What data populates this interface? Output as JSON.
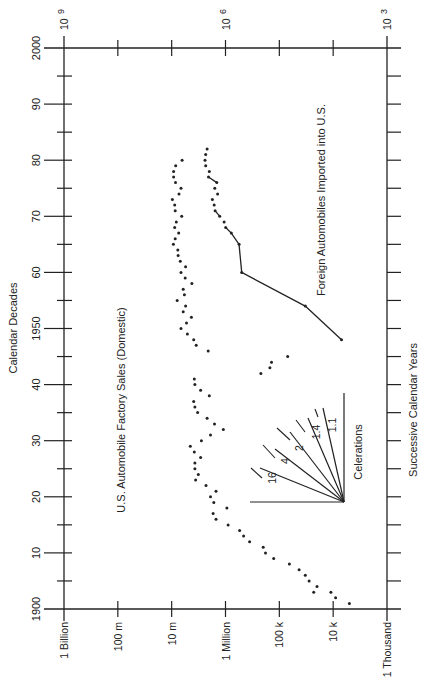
{
  "chart_data": {
    "type": "scatter",
    "orientation": "rotated-90-ccw",
    "title": "",
    "xlabel": "Calendar Decades",
    "ylabel": "",
    "secondary_xlabel": "Successive Calendar Years",
    "time_axis": {
      "label": "Calendar Decades",
      "secondary_label": "Successive Calendar Years",
      "range": [
        1900,
        2000
      ],
      "tick_labels": [
        "1900",
        "10",
        "20",
        "30",
        "40",
        "1950",
        "60",
        "70",
        "80",
        "90",
        "2000"
      ]
    },
    "value_axis": {
      "scale": "log",
      "range": [
        1000,
        1000000000
      ],
      "tick_labels": [
        "1 Billion",
        "100 m",
        "10 m",
        "1 Million",
        "100 k",
        "10 k",
        "1 Thousand"
      ],
      "top_tick_labels": [
        {
          "base": "10",
          "exp": "9"
        },
        {
          "base": "10",
          "exp": "6"
        },
        {
          "base": "10",
          "exp": "3"
        }
      ]
    },
    "grid": false,
    "legend": "inline annotations",
    "annotations": [
      "U.S. Automobile Factory Sales (Domestic)",
      "Foreign Automobiles Imported into U.S.",
      "Celerations"
    ],
    "celeration_fan": {
      "label": "Celerations",
      "lines": [
        "16",
        "4",
        "2",
        "1.4",
        "1.1"
      ]
    },
    "series": [
      {
        "name": "U.S. Automobile Factory Sales (Domestic)",
        "style": "dots",
        "points": [
          {
            "year": 1901,
            "value": 5000
          },
          {
            "year": 1902,
            "value": 9000
          },
          {
            "year": 1903,
            "value": 11000
          },
          {
            "year": 1903,
            "value": 23000
          },
          {
            "year": 1904,
            "value": 20000
          },
          {
            "year": 1905,
            "value": 28000
          },
          {
            "year": 1906,
            "value": 33000
          },
          {
            "year": 1907,
            "value": 43000
          },
          {
            "year": 1908,
            "value": 65000
          },
          {
            "year": 1909,
            "value": 127000
          },
          {
            "year": 1910,
            "value": 181000
          },
          {
            "year": 1911,
            "value": 199000
          },
          {
            "year": 1912,
            "value": 356000
          },
          {
            "year": 1913,
            "value": 462000
          },
          {
            "year": 1914,
            "value": 548000
          },
          {
            "year": 1915,
            "value": 896000
          },
          {
            "year": 1916,
            "value": 1500000
          },
          {
            "year": 1917,
            "value": 1700000
          },
          {
            "year": 1918,
            "value": 940000
          },
          {
            "year": 1919,
            "value": 1650000
          },
          {
            "year": 1920,
            "value": 1900000
          },
          {
            "year": 1921,
            "value": 1500000
          },
          {
            "year": 1922,
            "value": 2300000
          },
          {
            "year": 1923,
            "value": 3600000
          },
          {
            "year": 1924,
            "value": 3200000
          },
          {
            "year": 1925,
            "value": 3700000
          },
          {
            "year": 1926,
            "value": 3700000
          },
          {
            "year": 1927,
            "value": 2900000
          },
          {
            "year": 1928,
            "value": 3800000
          },
          {
            "year": 1929,
            "value": 4500000
          },
          {
            "year": 1930,
            "value": 2800000
          },
          {
            "year": 1931,
            "value": 1900000
          },
          {
            "year": 1932,
            "value": 1100000
          },
          {
            "year": 1933,
            "value": 1600000
          },
          {
            "year": 1934,
            "value": 2200000
          },
          {
            "year": 1935,
            "value": 3300000
          },
          {
            "year": 1936,
            "value": 3700000
          },
          {
            "year": 1937,
            "value": 3900000
          },
          {
            "year": 1938,
            "value": 2000000
          },
          {
            "year": 1939,
            "value": 2900000
          },
          {
            "year": 1940,
            "value": 3700000
          },
          {
            "year": 1941,
            "value": 3800000
          },
          {
            "year": 1942,
            "value": 220000
          },
          {
            "year": 1943,
            "value": 150000
          },
          {
            "year": 1944,
            "value": 140000
          },
          {
            "year": 1945,
            "value": 70000
          },
          {
            "year": 1946,
            "value": 2100000
          },
          {
            "year": 1947,
            "value": 3500000
          },
          {
            "year": 1948,
            "value": 3900000
          },
          {
            "year": 1949,
            "value": 5100000
          },
          {
            "year": 1950,
            "value": 6700000
          },
          {
            "year": 1951,
            "value": 5300000
          },
          {
            "year": 1952,
            "value": 4300000
          },
          {
            "year": 1953,
            "value": 6100000
          },
          {
            "year": 1954,
            "value": 5500000
          },
          {
            "year": 1955,
            "value": 7900000
          },
          {
            "year": 1956,
            "value": 5800000
          },
          {
            "year": 1957,
            "value": 6100000
          },
          {
            "year": 1958,
            "value": 4200000
          },
          {
            "year": 1959,
            "value": 5600000
          },
          {
            "year": 1960,
            "value": 6700000
          },
          {
            "year": 1961,
            "value": 5500000
          },
          {
            "year": 1962,
            "value": 6900000
          },
          {
            "year": 1963,
            "value": 7600000
          },
          {
            "year": 1964,
            "value": 7700000
          },
          {
            "year": 1965,
            "value": 9300000
          },
          {
            "year": 1966,
            "value": 8600000
          },
          {
            "year": 1967,
            "value": 7400000
          },
          {
            "year": 1968,
            "value": 8800000
          },
          {
            "year": 1969,
            "value": 8200000
          },
          {
            "year": 1970,
            "value": 6500000
          },
          {
            "year": 1971,
            "value": 8600000
          },
          {
            "year": 1972,
            "value": 8800000
          },
          {
            "year": 1973,
            "value": 9700000
          },
          {
            "year": 1974,
            "value": 7300000
          },
          {
            "year": 1975,
            "value": 6700000
          },
          {
            "year": 1976,
            "value": 8500000
          },
          {
            "year": 1977,
            "value": 9200000
          },
          {
            "year": 1978,
            "value": 9200000
          },
          {
            "year": 1979,
            "value": 8400000
          },
          {
            "year": 1980,
            "value": 6400000
          }
        ]
      },
      {
        "name": "Foreign Automobiles Imported into U.S.",
        "style": "dots-with-segments",
        "points": [
          {
            "year": 1948,
            "value": 7000
          },
          {
            "year": 1954,
            "value": 33000
          },
          {
            "year": 1960,
            "value": 500000
          },
          {
            "year": 1965,
            "value": 560000
          },
          {
            "year": 1967,
            "value": 780000
          },
          {
            "year": 1968,
            "value": 990000
          },
          {
            "year": 1969,
            "value": 1060000
          },
          {
            "year": 1970,
            "value": 1280000
          },
          {
            "year": 1971,
            "value": 1560000
          },
          {
            "year": 1972,
            "value": 1620000
          },
          {
            "year": 1973,
            "value": 1750000
          },
          {
            "year": 1974,
            "value": 1400000
          },
          {
            "year": 1975,
            "value": 1580000
          },
          {
            "year": 1976,
            "value": 1450000
          },
          {
            "year": 1977,
            "value": 2070000
          },
          {
            "year": 1978,
            "value": 2000000
          },
          {
            "year": 1979,
            "value": 2330000
          },
          {
            "year": 1980,
            "value": 2400000
          },
          {
            "year": 1981,
            "value": 2330000
          },
          {
            "year": 1982,
            "value": 2200000
          }
        ]
      }
    ]
  },
  "labels": {
    "time_axis_title": "Calendar Decades",
    "secondary_axis_title": "Successive Calendar Years",
    "domestic_series_label": "U.S. Automobile Factory Sales (Domestic)",
    "foreign_series_label": "Foreign Automobiles Imported into U.S.",
    "celerations_label": "Celerations",
    "celeration_values": [
      "16",
      "4",
      "2",
      "1.4",
      "1.1"
    ],
    "value_ticks": [
      "1 Billion",
      "100 m",
      "10 m",
      "1 Million",
      "100 k",
      "10 k",
      "1 Thousand"
    ],
    "decade_ticks": [
      "1900",
      "10",
      "20",
      "30",
      "40",
      "1950",
      "60",
      "70",
      "80",
      "90",
      "2000"
    ],
    "power_labels": [
      {
        "base": "10",
        "exp": "9"
      },
      {
        "base": "10",
        "exp": "6"
      },
      {
        "base": "10",
        "exp": "3"
      }
    ]
  },
  "colors": {
    "ink": "#222222",
    "background": "#ffffff"
  }
}
